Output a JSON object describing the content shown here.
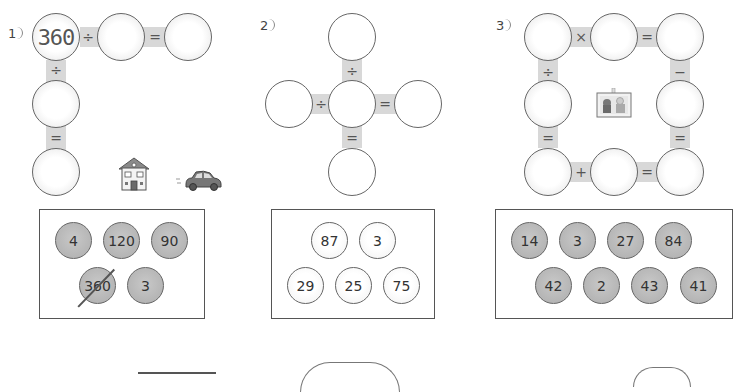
{
  "problems": [
    {
      "label": "1",
      "given_value": "360",
      "operators": {
        "top_first": "÷",
        "top_second": "=",
        "left_first": "÷",
        "left_second": "="
      },
      "choices": [
        {
          "value": "4",
          "crossed": false
        },
        {
          "value": "120",
          "crossed": false
        },
        {
          "value": "90",
          "crossed": false
        },
        {
          "value": "360",
          "crossed": true
        },
        {
          "value": "3",
          "crossed": false
        }
      ],
      "decorations": [
        "house-icon",
        "car-icon"
      ]
    },
    {
      "label": "2",
      "operators": {
        "vertical_top": "÷",
        "horizontal_left": "÷",
        "horizontal_right": "=",
        "vertical_bottom": "="
      },
      "choices": [
        {
          "value": "87"
        },
        {
          "value": "3"
        },
        {
          "value": "29"
        },
        {
          "value": "25"
        },
        {
          "value": "75"
        }
      ]
    },
    {
      "label": "3",
      "operators": {
        "top_left": "×",
        "top_right": "=",
        "left_top": "÷",
        "left_bottom": "=",
        "right_top": "−",
        "right_bottom": "=",
        "bottom_left": "+",
        "bottom_right": "="
      },
      "choices": [
        {
          "value": "14"
        },
        {
          "value": "3"
        },
        {
          "value": "27"
        },
        {
          "value": "84"
        },
        {
          "value": "42"
        },
        {
          "value": "2"
        },
        {
          "value": "43"
        },
        {
          "value": "41"
        }
      ],
      "decorations": [
        "photo-frame-icon"
      ]
    }
  ]
}
